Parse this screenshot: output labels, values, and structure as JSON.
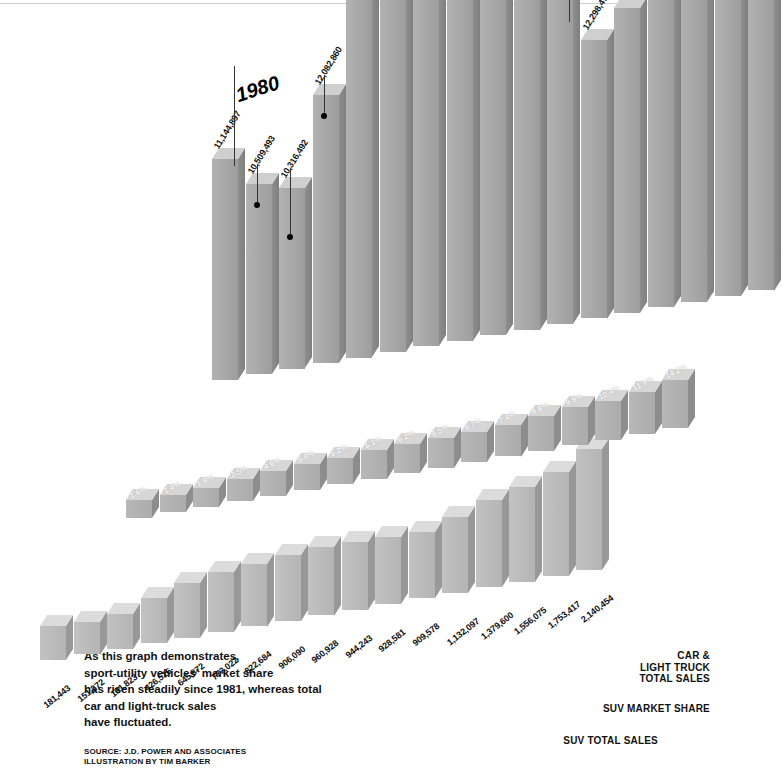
{
  "chart_data": {
    "type": "bar",
    "title": "",
    "subtitle": "",
    "xlabel": "",
    "ylabel": "",
    "grid": false,
    "legend_position": "bottom-right",
    "projection": "3d-isometric",
    "categories": [
      "1979",
      "1980",
      "1981",
      "1982",
      "1983",
      "1984",
      "1985",
      "1986",
      "1987",
      "1988",
      "1989",
      "1990",
      "1991",
      "1992",
      "1993",
      "1994",
      "1995"
    ],
    "year_markers": [
      {
        "label": "1980",
        "index": 1
      },
      {
        "label": "1985",
        "index": 6
      },
      {
        "label": "1990",
        "index": 11
      },
      {
        "label": "1995",
        "index": 16
      }
    ],
    "series": [
      {
        "name": "CAR & LIGHT TRUCK TOTAL SALES",
        "unit": "vehicles",
        "labels": [
          "11,144,897",
          "10,509,493",
          "10,316,492",
          "12,082,860",
          "14,170,340",
          "15,336,231",
          "15,962,547",
          "14,836,559",
          "15,434,556",
          "14,523,645",
          "13,864,210",
          "12,298,470",
          "12,837,971",
          "13,886,657",
          "15,030,703",
          "14,732,371",
          "15,108,520"
        ],
        "values": [
          11144897,
          10509493,
          10316492,
          12082860,
          14170340,
          15336231,
          15962547,
          14836559,
          15434556,
          14523645,
          13864210,
          12298470,
          12837971,
          13886657,
          15030703,
          14732371,
          15108520
        ]
      },
      {
        "name": "SUV MARKET SHARE",
        "unit": "percent",
        "labels": [
          "1.6%",
          "1.4%",
          "1.9%",
          "3.5%",
          "4.6%",
          "5.0%",
          "5.2%",
          "6.1%",
          "6.2%",
          "6.5%",
          "6.7%",
          "7.4%",
          "8.8%",
          "9.9%",
          "10.4%",
          "11.9%",
          "14.2%"
        ],
        "values": [
          1.6,
          1.4,
          1.9,
          3.5,
          4.6,
          5.0,
          5.2,
          6.1,
          6.2,
          6.5,
          6.7,
          7.4,
          8.8,
          9.9,
          10.4,
          11.9,
          14.2
        ]
      },
      {
        "name": "SUV TOTAL SALES",
        "unit": "vehicles",
        "labels": [
          "181,443",
          "151,272",
          "191,823",
          "426,516",
          "645,872",
          "773,022",
          "822,684",
          "906,090",
          "960,928",
          "944,243",
          "928,581",
          "909,578",
          "1,132,097",
          "1,379,600",
          "1,556,075",
          "1,753,417",
          "2,140,454"
        ],
        "values": [
          181443,
          151272,
          191823,
          426516,
          645872,
          773022,
          822684,
          906090,
          960928,
          944243,
          928581,
          909578,
          1132097,
          1379600,
          1556075,
          1753417,
          2140454
        ]
      }
    ]
  },
  "caption": {
    "text": "As this graph demonstrates, sport-utility vehicles' market share has risen steadily since 1981, whereas total car and light-truck sales have fluctuated.",
    "lines": [
      "As this graph demonstrates,",
      "sport-utility vehicles' market share",
      "has risen steadily since 1981, whereas total",
      "car and light-truck sales",
      "have fluctuated."
    ]
  },
  "credit": {
    "source": "SOURCE: J.D. POWER AND ASSOCIATES",
    "illustration": "ILLUSTRATION BY TIM BARKER"
  },
  "legend": {
    "cars": "CAR &\nLIGHT TRUCK\nTOTAL SALES",
    "share": "SUV MARKET SHARE",
    "suv": "SUV TOTAL SALES"
  },
  "colors": {
    "bar_front": "#a8a8a8",
    "bar_side": "#8b8b8b",
    "bar_top": "#d2d2d2",
    "background": "#ffffff",
    "text": "#111111",
    "pct_text": "#ffffff"
  }
}
